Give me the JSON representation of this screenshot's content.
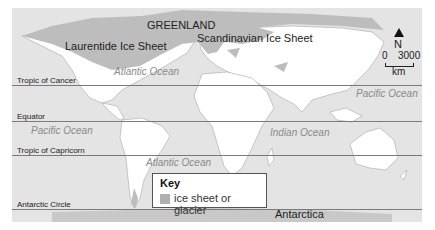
{
  "map": {
    "type": "world map, last glacial maximum ice extent",
    "colors": {
      "ocean": "#e4e4e4",
      "land": "#ffffff",
      "ice": "#bdbdbd",
      "lines": "#7a7a7a"
    },
    "regions": {
      "greenland": "GREENLAND",
      "laurentide": "Laurentide Ice Sheet",
      "scandinavian": "Scandinavian Ice Sheet",
      "antarctica": "Antarctica"
    },
    "oceans": {
      "atlantic_north": "Atlantic Ocean",
      "pacific_east": "Pacific Ocean",
      "pacific_west": "Pacific Ocean",
      "indian": "Indian Ocean",
      "atlantic_south": "Atlantic Ocean"
    },
    "latitude_lines": {
      "cancer": "Tropic of Cancer",
      "equator": "Equator",
      "capricorn": "Tropic of Capricorn",
      "antarctic": "Antarctic Circle"
    },
    "compass": {
      "north": "N",
      "scale_start": "0",
      "scale_end": "3000",
      "unit": "km"
    },
    "key": {
      "title": "Key",
      "item": "ice sheet or glacier",
      "swatch_color": "#b0b0b0"
    }
  }
}
